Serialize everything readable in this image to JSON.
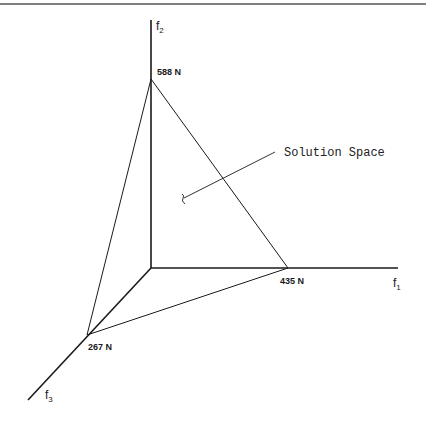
{
  "diagram": {
    "axes": {
      "f1": {
        "name": "f",
        "sub": "1"
      },
      "f2": {
        "name": "f",
        "sub": "2"
      },
      "f3": {
        "name": "f",
        "sub": "3"
      }
    },
    "vertices": {
      "f1_intercept": "435 N",
      "f2_intercept": "588 N",
      "f3_intercept": "267 N"
    },
    "annotation": "Solution Space",
    "colors": {
      "line": "#1a1a1a",
      "background": "#ffffff"
    }
  }
}
